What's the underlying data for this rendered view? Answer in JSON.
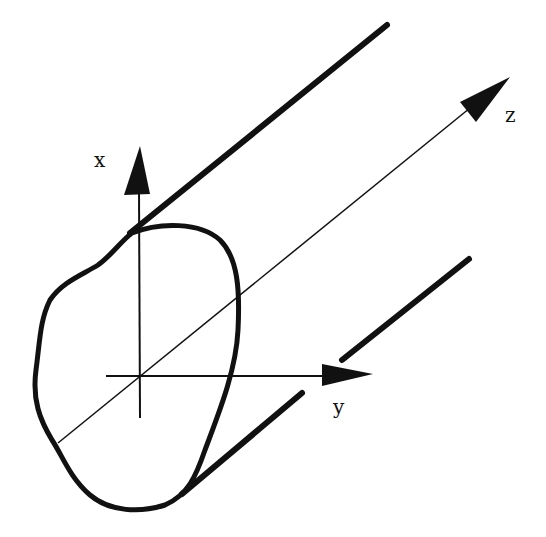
{
  "diagram": {
    "labels": {
      "x": "x",
      "y": "y",
      "z": "z"
    },
    "colors": {
      "stroke": "#111111",
      "background": "#ffffff"
    }
  }
}
